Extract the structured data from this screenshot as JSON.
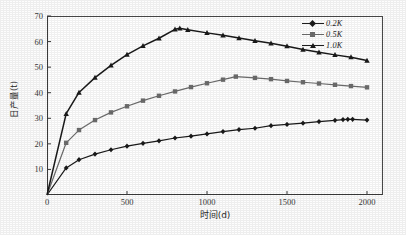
{
  "chart_data": {
    "type": "line",
    "title": "",
    "xlabel": "时间(d)",
    "ylabel": "日产量(t)",
    "xlim": [
      0,
      2100
    ],
    "ylim": [
      0,
      70
    ],
    "xticks": [
      0,
      500,
      1000,
      1500,
      2000
    ],
    "yticks": [
      10,
      20,
      30,
      40,
      50,
      60,
      70
    ],
    "grid": false,
    "legend_position": "top-right",
    "series": [
      {
        "name": "0.2K",
        "marker": "diamond",
        "color": "#1a1a1a",
        "x": [
          0,
          120,
          200,
          300,
          400,
          500,
          600,
          700,
          800,
          900,
          1000,
          1100,
          1200,
          1300,
          1400,
          1500,
          1600,
          1700,
          1800,
          1850,
          1880,
          1910,
          2000
        ],
        "y": [
          0,
          10.6,
          13.8,
          16.0,
          17.7,
          19.1,
          20.2,
          21.2,
          22.3,
          23.0,
          23.9,
          24.8,
          25.6,
          26.1,
          27.1,
          27.6,
          28.1,
          28.7,
          29.2,
          29.5,
          29.6,
          29.6,
          29.3
        ]
      },
      {
        "name": "0.5K",
        "marker": "square",
        "color": "#6d6d6d",
        "x": [
          0,
          120,
          200,
          300,
          400,
          500,
          600,
          700,
          800,
          900,
          1000,
          1100,
          1180,
          1300,
          1400,
          1500,
          1600,
          1700,
          1800,
          1900,
          2000
        ],
        "y": [
          0,
          20.4,
          25.4,
          29.3,
          32.3,
          34.7,
          36.9,
          38.8,
          40.5,
          42.2,
          43.7,
          45.1,
          46.3,
          45.8,
          45.3,
          44.6,
          44.1,
          43.6,
          43.1,
          42.6,
          42.1
        ]
      },
      {
        "name": "1.0K",
        "marker": "triangle",
        "color": "#1a1a1a",
        "x": [
          0,
          120,
          200,
          300,
          400,
          500,
          600,
          700,
          800,
          830,
          880,
          1000,
          1100,
          1200,
          1300,
          1400,
          1500,
          1600,
          1700,
          1800,
          1900,
          2000
        ],
        "y": [
          0,
          31.8,
          40.1,
          45.9,
          50.7,
          54.9,
          58.3,
          61.3,
          64.8,
          65.2,
          64.6,
          63.4,
          62.5,
          61.4,
          60.3,
          59.3,
          58.2,
          56.9,
          55.8,
          54.8,
          53.9,
          52.6
        ]
      }
    ]
  },
  "legend": {
    "items": [
      {
        "label": "0.2K"
      },
      {
        "label": "0.5K"
      },
      {
        "label": "1.0K"
      }
    ]
  }
}
